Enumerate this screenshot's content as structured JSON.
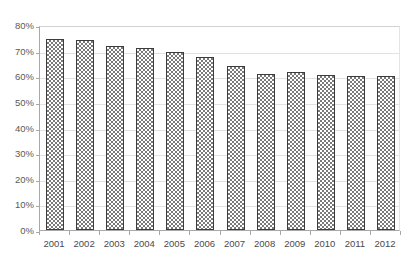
{
  "chart_data": {
    "type": "bar",
    "title": "",
    "subtitle": "",
    "xlabel": "",
    "ylabel": "",
    "categories": [
      "2001",
      "2002",
      "2003",
      "2004",
      "2005",
      "2006",
      "2007",
      "2008",
      "2009",
      "2010",
      "2011",
      "2012"
    ],
    "values": [
      74.5,
      74,
      72,
      71,
      69.5,
      67.5,
      64,
      61,
      61.5,
      60.5,
      60,
      60
    ],
    "value_unit": "%",
    "series": [
      {
        "name": "",
        "values": [
          74.5,
          74,
          72,
          71,
          69.5,
          67.5,
          64,
          61,
          61.5,
          60.5,
          60,
          60
        ]
      }
    ],
    "ylim": [
      0,
      80
    ],
    "ytick_values": [
      0,
      10,
      20,
      30,
      40,
      50,
      60,
      70,
      80
    ],
    "ytick_labels": [
      "0%",
      "10%",
      "20%",
      "30%",
      "40%",
      "50%",
      "60%",
      "70%",
      "80%"
    ],
    "grid": true,
    "grid_axis": "y",
    "legend": false,
    "legend_position": "none",
    "annotations": [],
    "bar_fill": "checkerboard-pattern",
    "colors": {
      "bar_fill_pattern": "#7a7a7a",
      "bar_background": "#ffffff",
      "bar_border": "#3c3c3c",
      "gridline": "#e2e2e2",
      "axis_line": "#a8a8a8",
      "tick_label": "#5a5a5a",
      "plot_background": "#ffffff"
    }
  }
}
